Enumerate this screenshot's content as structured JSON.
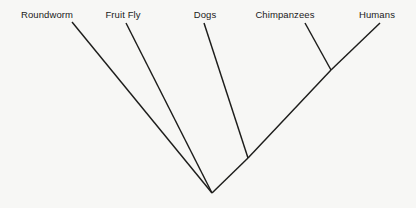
{
  "diagram": {
    "kind": "cladogram",
    "title": "",
    "background_color": "#f7f7f5",
    "line_color": "#1d1d1b",
    "width": 416,
    "height": 208
  },
  "taxa": [
    {
      "name": "Roundworm",
      "label": "Roundworm",
      "label_x": 47,
      "label_y": 10
    },
    {
      "name": "Fruit Fly",
      "label": "Fruit Fly",
      "label_x": 123,
      "label_y": 10
    },
    {
      "name": "Dogs",
      "label": "Dogs",
      "label_x": 205,
      "label_y": 10
    },
    {
      "name": "Chimpanzees",
      "label": "Chimpanzees",
      "label_x": 285,
      "label_y": 10
    },
    {
      "name": "Humans",
      "label": "Humans",
      "label_x": 377,
      "label_y": 10
    }
  ],
  "branches": [
    {
      "name": "roundworm-branch",
      "x1": 72,
      "y1": 22,
      "x2": 212,
      "y2": 193
    },
    {
      "name": "fruitfly-branch",
      "x1": 126,
      "y1": 23,
      "x2": 212,
      "y2": 193
    },
    {
      "name": "dogs-branch",
      "x1": 204,
      "y1": 23,
      "x2": 248,
      "y2": 158
    },
    {
      "name": "chimpanzees-branch",
      "x1": 305,
      "y1": 23,
      "x2": 331,
      "y2": 70
    },
    {
      "name": "humans-branch",
      "x1": 380,
      "y1": 23,
      "x2": 331,
      "y2": 70
    },
    {
      "name": "primate-stem",
      "x1": 331,
      "y1": 70,
      "x2": 248,
      "y2": 158
    },
    {
      "name": "mammal-stem",
      "x1": 248,
      "y1": 158,
      "x2": 212,
      "y2": 193
    }
  ],
  "nodes": [
    {
      "name": "root-node",
      "x": 212,
      "y": 193
    },
    {
      "name": "dogs-primates-node",
      "x": 248,
      "y": 158
    },
    {
      "name": "chimp-human-node",
      "x": 331,
      "y": 70
    }
  ]
}
